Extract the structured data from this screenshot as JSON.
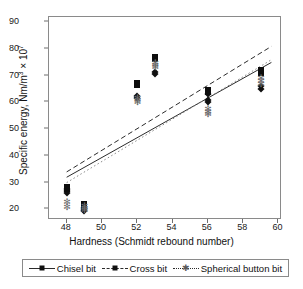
{
  "chart_data": {
    "type": "scatter",
    "title": "",
    "xlabel": "Hardness (Schmidt rebound number)",
    "ylabel": "Specific energy, Nm/m³ × 10⁷",
    "ylabel_parts": {
      "prefix": "Specific energy, Nm/m",
      "sup1": "3",
      "mid": " × 10",
      "sup2": "7"
    },
    "xlim": [
      47,
      60.2
    ],
    "ylim": [
      16,
      92
    ],
    "xticks": [
      48,
      50,
      52,
      54,
      56,
      58,
      60
    ],
    "yticks": [
      20,
      30,
      40,
      50,
      60,
      70,
      80,
      90
    ],
    "grid": false,
    "legend_position": "below-axes",
    "series": [
      {
        "name": "Chisel bit",
        "marker": "diamond",
        "linestyle": "solid",
        "color": "#101010",
        "points": [
          {
            "x": 48,
            "y": 26.2
          },
          {
            "x": 48,
            "y": 26.9
          },
          {
            "x": 48,
            "y": 27.5
          },
          {
            "x": 49,
            "y": 19.2
          },
          {
            "x": 49,
            "y": 19.9
          },
          {
            "x": 49,
            "y": 20.6
          },
          {
            "x": 52,
            "y": 61.7
          },
          {
            "x": 52,
            "y": 62.4
          },
          {
            "x": 53,
            "y": 70.8
          },
          {
            "x": 53,
            "y": 71.4
          },
          {
            "x": 56,
            "y": 60.2
          },
          {
            "x": 56,
            "y": 61.0
          },
          {
            "x": 56,
            "y": 63.2
          },
          {
            "x": 59,
            "y": 65.2
          },
          {
            "x": 59,
            "y": 66.0
          }
        ],
        "trend": {
          "x1": 48,
          "y1": 32.0,
          "x2": 59.6,
          "y2": 75.0
        }
      },
      {
        "name": "Cross bit",
        "marker": "square",
        "linestyle": "dashed",
        "color": "#0d0d0d",
        "points": [
          {
            "x": 48,
            "y": 27.6
          },
          {
            "x": 48,
            "y": 28.3
          },
          {
            "x": 49,
            "y": 21.3
          },
          {
            "x": 49,
            "y": 22.1
          },
          {
            "x": 52,
            "y": 66.5
          },
          {
            "x": 52,
            "y": 67.2
          },
          {
            "x": 53,
            "y": 76.2
          },
          {
            "x": 53,
            "y": 77.0
          },
          {
            "x": 56,
            "y": 63.8
          },
          {
            "x": 56,
            "y": 64.5
          },
          {
            "x": 59,
            "y": 71.2
          },
          {
            "x": 59,
            "y": 72.0
          }
        ],
        "trend": {
          "x1": 48,
          "y1": 34.0,
          "x2": 59.6,
          "y2": 81.0
        }
      },
      {
        "name": "Spherical button bit",
        "marker": "star",
        "linestyle": "dotted",
        "color": "#6b6b6b",
        "points": [
          {
            "x": 48,
            "y": 20.8
          },
          {
            "x": 48,
            "y": 22.6
          },
          {
            "x": 49,
            "y": 19.6
          },
          {
            "x": 49,
            "y": 20.4
          },
          {
            "x": 49,
            "y": 21.2
          },
          {
            "x": 52,
            "y": 60.2
          },
          {
            "x": 52,
            "y": 60.9
          },
          {
            "x": 52,
            "y": 61.8
          },
          {
            "x": 53,
            "y": 73.2
          },
          {
            "x": 53,
            "y": 74.0
          },
          {
            "x": 53,
            "y": 74.8
          },
          {
            "x": 56,
            "y": 55.8
          },
          {
            "x": 56,
            "y": 56.6
          },
          {
            "x": 56,
            "y": 57.6
          },
          {
            "x": 59,
            "y": 67.0
          },
          {
            "x": 59,
            "y": 68.0
          },
          {
            "x": 59,
            "y": 69.0
          }
        ],
        "trend": {
          "x1": 48,
          "y1": 30.0,
          "x2": 59.6,
          "y2": 76.0
        }
      }
    ]
  },
  "legend": {
    "items": [
      {
        "label": "Chisel bit",
        "marker": "diamond-marker-icon",
        "linestyle": "solid"
      },
      {
        "label": "Cross bit",
        "marker": "square-marker-icon",
        "linestyle": "dashed"
      },
      {
        "label": "Spherical button bit",
        "marker": "star-marker-icon",
        "linestyle": "dotted"
      }
    ]
  }
}
